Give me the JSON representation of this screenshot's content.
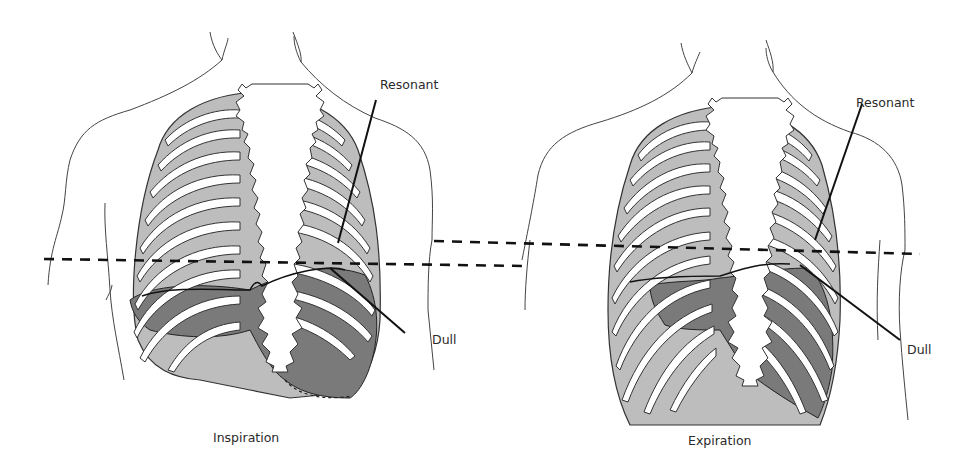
{
  "figure": {
    "panels": [
      {
        "id": "inspiration",
        "caption": "Inspiration",
        "labels": {
          "resonant": "Resonant",
          "dull": "Dull"
        }
      },
      {
        "id": "expiration",
        "caption": "Expiration",
        "labels": {
          "resonant": "Resonant",
          "dull": "Dull"
        }
      }
    ],
    "colors": {
      "outline": "#333333",
      "rib": "#ffffff",
      "resonant_fill": "#bdbdbd",
      "dull_fill": "#7a7a7a",
      "dashed_line": "#111111"
    }
  }
}
